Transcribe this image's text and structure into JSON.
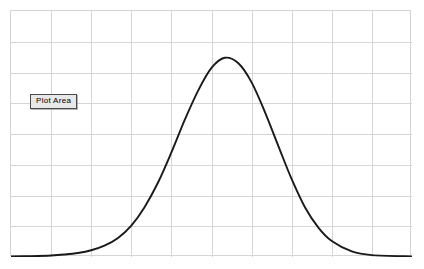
{
  "tooltip": {
    "label": "Plot Area"
  },
  "plot": {
    "background_color": "#ffffff",
    "border_color": "#d4d4d4",
    "grid_color": "#d6d6d6",
    "series_color": "#1a1a1a"
  },
  "chart_data": {
    "type": "line",
    "title": "",
    "subtitle": "",
    "xlabel": "",
    "ylabel": "",
    "grid": true,
    "legend": "none",
    "annotations": [
      "Plot Area"
    ],
    "x_gridlines": 10,
    "y_gridlines": 8,
    "xlim": [
      0,
      10
    ],
    "ylim": [
      0,
      8
    ],
    "x_tick_labels": [],
    "y_tick_labels": [],
    "series": [
      {
        "name": "Normal distribution curve",
        "x": [
          0.0,
          0.5,
          1.0,
          1.33,
          1.67,
          2.0,
          2.33,
          2.67,
          3.0,
          3.33,
          3.67,
          4.0,
          4.33,
          4.67,
          5.0,
          5.33,
          5.67,
          6.0,
          6.33,
          6.67,
          7.0,
          7.33,
          7.67,
          8.0,
          8.5,
          9.0,
          10.0
        ],
        "y": [
          0.02,
          0.03,
          0.05,
          0.08,
          0.13,
          0.22,
          0.37,
          0.62,
          1.02,
          1.62,
          2.43,
          3.4,
          4.45,
          5.42,
          6.15,
          6.48,
          6.3,
          5.68,
          4.72,
          3.6,
          2.53,
          1.62,
          0.95,
          0.52,
          0.18,
          0.06,
          0.02
        ]
      }
    ]
  }
}
